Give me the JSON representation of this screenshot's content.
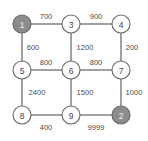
{
  "figure": {
    "kind": "weighted-grid-graph",
    "background_color": "#ffffff",
    "node_outline_color": "#666666",
    "node_fill_color": "#ffffff",
    "node_highlight_fill_color": "#8c8c8c",
    "node_highlight_text_color": "#f2f2f2",
    "edge_color": "#555555",
    "label_color": "#4a4a4a",
    "width": 148,
    "height": 141
  },
  "chart_data": {
    "type": "diagram",
    "title": "",
    "xlabel": "",
    "ylabel": "",
    "layout": "3x3 grid",
    "nodes": [
      {
        "id": "n1",
        "label": "1",
        "x": 22,
        "y": 24,
        "r": 9,
        "highlighted": true
      },
      {
        "id": "n3",
        "label": "3",
        "x": 71,
        "y": 24,
        "r": 9,
        "highlighted": false
      },
      {
        "id": "n4",
        "label": "4",
        "x": 121,
        "y": 24,
        "r": 9,
        "highlighted": false
      },
      {
        "id": "n5",
        "label": "5",
        "x": 22,
        "y": 70,
        "r": 9,
        "highlighted": false
      },
      {
        "id": "n6",
        "label": "6",
        "x": 71,
        "y": 70,
        "r": 9,
        "highlighted": false
      },
      {
        "id": "n7",
        "label": "7",
        "x": 121,
        "y": 70,
        "r": 9,
        "highlighted": false
      },
      {
        "id": "n8",
        "label": "8",
        "x": 22,
        "y": 115,
        "r": 9,
        "highlighted": false
      },
      {
        "id": "n9",
        "label": "9",
        "x": 71,
        "y": 115,
        "r": 9,
        "highlighted": false
      },
      {
        "id": "n2",
        "label": "2",
        "x": 121,
        "y": 115,
        "r": 9,
        "highlighted": true
      }
    ],
    "edges": [
      {
        "id": "e1-3",
        "from": "n1",
        "to": "n3",
        "weight": "700",
        "x1": 31,
        "y1": 24,
        "x2": 62,
        "y2": 24,
        "lx": 46,
        "ly": 16
      },
      {
        "id": "e3-4",
        "from": "n3",
        "to": "n4",
        "weight": "900",
        "x1": 80,
        "y1": 24,
        "x2": 112,
        "y2": 24,
        "lx": 96,
        "ly": 16
      },
      {
        "id": "e1-5",
        "from": "n1",
        "to": "n5",
        "weight": "600",
        "x1": 22,
        "y1": 33,
        "x2": 22,
        "y2": 61,
        "lx": 33,
        "ly": 47
      },
      {
        "id": "e3-6",
        "from": "n3",
        "to": "n6",
        "weight": "1200",
        "x1": 71,
        "y1": 33,
        "x2": 71,
        "y2": 61,
        "lx": 85,
        "ly": 47
      },
      {
        "id": "e4-7",
        "from": "n4",
        "to": "n7",
        "weight": "200",
        "x1": 121,
        "y1": 33,
        "x2": 121,
        "y2": 61,
        "lx": 132,
        "ly": 47
      },
      {
        "id": "e5-6",
        "from": "n5",
        "to": "n6",
        "weight": "800",
        "x1": 31,
        "y1": 70,
        "x2": 62,
        "y2": 70,
        "lx": 46,
        "ly": 62
      },
      {
        "id": "e6-7",
        "from": "n6",
        "to": "n7",
        "weight": "800",
        "x1": 80,
        "y1": 70,
        "x2": 112,
        "y2": 70,
        "lx": 96,
        "ly": 62
      },
      {
        "id": "e5-8",
        "from": "n5",
        "to": "n8",
        "weight": "2400",
        "x1": 22,
        "y1": 79,
        "x2": 22,
        "y2": 106,
        "lx": 37,
        "ly": 92
      },
      {
        "id": "e6-9",
        "from": "n6",
        "to": "n9",
        "weight": "1500",
        "x1": 71,
        "y1": 79,
        "x2": 71,
        "y2": 106,
        "lx": 85,
        "ly": 92
      },
      {
        "id": "e7-2",
        "from": "n7",
        "to": "n2",
        "weight": "1000",
        "x1": 121,
        "y1": 79,
        "x2": 121,
        "y2": 106,
        "lx": 134,
        "ly": 92
      },
      {
        "id": "e8-9",
        "from": "n8",
        "to": "n9",
        "weight": "400",
        "x1": 31,
        "y1": 115,
        "x2": 62,
        "y2": 115,
        "lx": 46,
        "ly": 127
      },
      {
        "id": "e9-2",
        "from": "n9",
        "to": "n2",
        "weight": "9999",
        "x1": 80,
        "y1": 115,
        "x2": 112,
        "y2": 115,
        "lx": 96,
        "ly": 127
      }
    ]
  }
}
